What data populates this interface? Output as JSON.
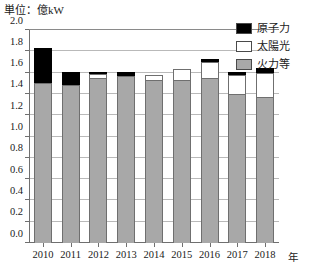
{
  "unit_label": "単位：億kW",
  "x_axis_unit": "年",
  "legend": {
    "items": [
      {
        "label": "原子力",
        "color": "#000000"
      },
      {
        "label": "太陽光",
        "color": "#ffffff"
      },
      {
        "label": "火力等",
        "color": "#a8a8a8"
      }
    ]
  },
  "y_axis": {
    "ticks": [
      "0.0",
      "0.2",
      "0.4",
      "0.6",
      "0.8",
      "1.0",
      "1.2",
      "1.4",
      "1.6",
      "1.8",
      "2.0"
    ]
  },
  "chart_data": {
    "type": "bar",
    "stacked": true,
    "title": "",
    "subtitle": "",
    "xlabel": "年",
    "ylabel": "億kW",
    "ylim": [
      0.0,
      2.0
    ],
    "ytick_step": 0.2,
    "grid": true,
    "legend_position": "top-right",
    "categories": [
      "2010",
      "2011",
      "2012",
      "2013",
      "2014",
      "2015",
      "2016",
      "2017",
      "2018"
    ],
    "series": [
      {
        "name": "火力等",
        "color": "#a8a8a8",
        "values": [
          1.5,
          1.48,
          1.55,
          1.57,
          1.53,
          1.53,
          1.55,
          1.4,
          1.37
        ]
      },
      {
        "name": "太陽光",
        "color": "#ffffff",
        "values": [
          0.0,
          0.0,
          0.04,
          0.0,
          0.05,
          0.1,
          0.15,
          0.18,
          0.23
        ]
      },
      {
        "name": "原子力",
        "color": "#000000",
        "values": [
          0.33,
          0.13,
          0.02,
          0.04,
          0.0,
          0.0,
          0.03,
          0.03,
          0.04
        ]
      }
    ],
    "totals": [
      1.83,
      1.61,
      1.61,
      1.61,
      1.58,
      1.63,
      1.73,
      1.61,
      1.64
    ]
  }
}
